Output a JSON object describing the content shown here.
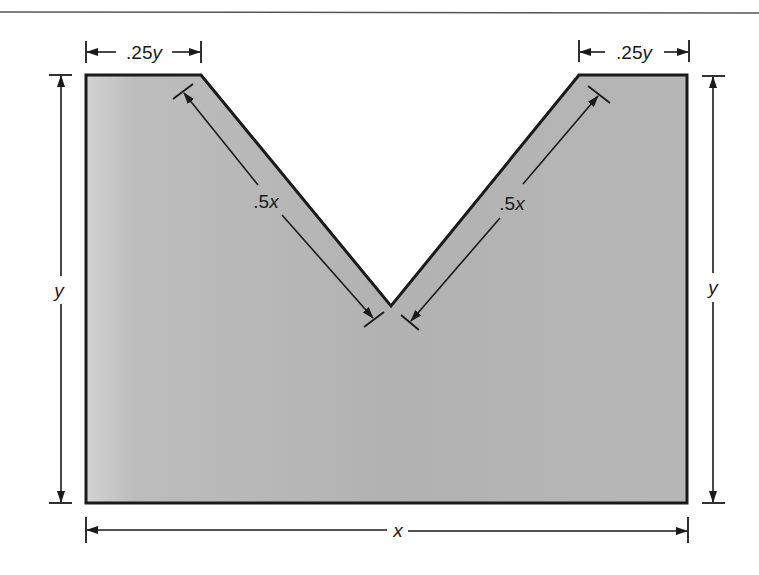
{
  "diagram": {
    "type": "dimensioned-shape",
    "colors": {
      "fill": "#b4b4b4",
      "fill_light": "#cfcfcf",
      "outline": "#1a1a1a",
      "background": "#ffffff"
    },
    "labels": {
      "top_left_width": {
        "prefix": ".25",
        "var": "y"
      },
      "top_right_width": {
        "prefix": ".25",
        "var": "y"
      },
      "left_slant_length": {
        "prefix": ".5",
        "var": "x"
      },
      "right_slant_length": {
        "prefix": ".5",
        "var": "x"
      },
      "left_height": {
        "prefix": "",
        "var": "y"
      },
      "right_height": {
        "prefix": "",
        "var": "y"
      },
      "bottom_width": {
        "prefix": "",
        "var": "x"
      }
    },
    "dimensions": [
      {
        "name": "overall width",
        "value": "x"
      },
      {
        "name": "overall height",
        "value": "y"
      },
      {
        "name": "top flat segments",
        "value": ".25y"
      },
      {
        "name": "V-notch slant sides",
        "value": ".5x"
      }
    ]
  }
}
